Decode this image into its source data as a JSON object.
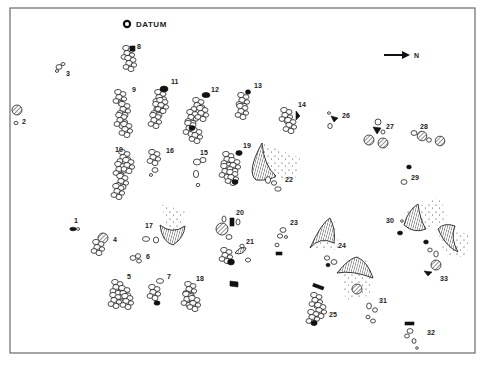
{
  "diagram": {
    "datum_label": "DATUM",
    "north_label": "N",
    "features": [
      {
        "id": "1",
        "x": 75,
        "y": 223
      },
      {
        "id": "2",
        "x": 20,
        "y": 121
      },
      {
        "id": "3",
        "x": 66,
        "y": 74
      },
      {
        "id": "4",
        "x": 114,
        "y": 240
      },
      {
        "id": "5",
        "x": 128,
        "y": 278
      },
      {
        "id": "6",
        "x": 146,
        "y": 259
      },
      {
        "id": "7",
        "x": 168,
        "y": 279
      },
      {
        "id": "8",
        "x": 138,
        "y": 48
      },
      {
        "id": "9",
        "x": 132,
        "y": 91
      },
      {
        "id": "10",
        "x": 118,
        "y": 151
      },
      {
        "id": "11",
        "x": 172,
        "y": 83
      },
      {
        "id": "12",
        "x": 213,
        "y": 90
      },
      {
        "id": "13",
        "x": 256,
        "y": 86
      },
      {
        "id": "14",
        "x": 300,
        "y": 106
      },
      {
        "id": "15",
        "x": 202,
        "y": 154
      },
      {
        "id": "16",
        "x": 167,
        "y": 152
      },
      {
        "id": "17",
        "x": 147,
        "y": 226
      },
      {
        "id": "18",
        "x": 198,
        "y": 279
      },
      {
        "id": "19",
        "x": 245,
        "y": 146
      },
      {
        "id": "20",
        "x": 238,
        "y": 213
      },
      {
        "id": "21",
        "x": 246,
        "y": 242
      },
      {
        "id": "22",
        "x": 286,
        "y": 181
      },
      {
        "id": "23",
        "x": 292,
        "y": 224
      },
      {
        "id": "24",
        "x": 323,
        "y": 246
      },
      {
        "id": "25",
        "x": 328,
        "y": 316
      },
      {
        "id": "26",
        "x": 344,
        "y": 117
      },
      {
        "id": "27",
        "x": 385,
        "y": 127
      },
      {
        "id": "28",
        "x": 420,
        "y": 127
      },
      {
        "id": "29",
        "x": 412,
        "y": 178
      },
      {
        "id": "30",
        "x": 388,
        "y": 221
      },
      {
        "id": "31",
        "x": 379,
        "y": 301
      },
      {
        "id": "32",
        "x": 427,
        "y": 333
      },
      {
        "id": "33",
        "x": 442,
        "y": 279
      }
    ]
  }
}
